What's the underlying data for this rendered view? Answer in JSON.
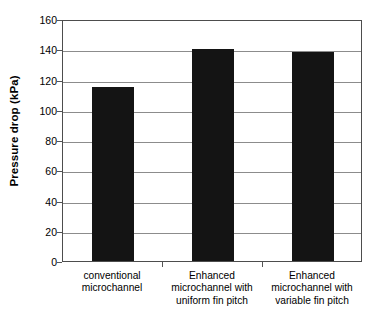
{
  "chart_data": {
    "type": "bar",
    "title": "",
    "xlabel": "",
    "ylabel": "Pressure drop (kPa)",
    "categories": [
      "conventional microchannel",
      "Enhanced microchannel with uniform fin pitch",
      "Enhanced microchannel with variable fin pitch"
    ],
    "category_lines": [
      [
        "conventional",
        "microchannel"
      ],
      [
        "Enhanced",
        "microchannel with",
        "uniform fin pitch"
      ],
      [
        "Enhanced",
        "microchannel with",
        "variable fin pitch"
      ]
    ],
    "values": [
      115,
      140,
      138
    ],
    "ylim": [
      0,
      160
    ],
    "ytick_step": 20,
    "ytick_labels": [
      "160",
      "140",
      "120",
      "100",
      "80",
      "60",
      "40",
      "20",
      "0"
    ],
    "ytick_values": [
      160,
      140,
      120,
      100,
      80,
      60,
      40,
      20,
      0
    ],
    "grid": "horizontal",
    "legend": "none",
    "bar_color": "#141414",
    "gridline_color": "#8c8c8c",
    "axis_color": "#4d4d4d",
    "background_color": "#ffffff"
  }
}
